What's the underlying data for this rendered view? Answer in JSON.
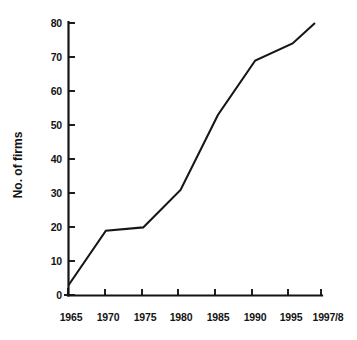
{
  "chart_data": {
    "type": "line",
    "title": "",
    "xlabel": "",
    "ylabel": "No. of firms",
    "x": [
      1965,
      1970,
      1975,
      1980,
      1985,
      1990,
      1995,
      1998
    ],
    "xtick_labels": [
      "1965",
      "1970",
      "1975",
      "1980",
      "1985",
      "1990",
      "1995",
      "1997/8"
    ],
    "values": [
      3,
      19,
      20,
      31,
      53,
      69,
      74,
      80
    ],
    "series": [
      {
        "name": "No. of firms",
        "values": [
          3,
          19,
          20,
          31,
          53,
          69,
          74,
          80
        ]
      }
    ],
    "ytick_labels": [
      "0",
      "10",
      "20",
      "30",
      "40",
      "50",
      "60",
      "70",
      "80"
    ],
    "ytick_values": [
      0,
      10,
      20,
      30,
      40,
      50,
      60,
      70,
      80
    ],
    "ylim": [
      0,
      80
    ],
    "xlim": [
      1965,
      1998
    ],
    "grid": false,
    "legend": false,
    "legend_position": "none",
    "line_color": "#161616",
    "axis_color": "#141414",
    "background_color": "#ffffff"
  }
}
